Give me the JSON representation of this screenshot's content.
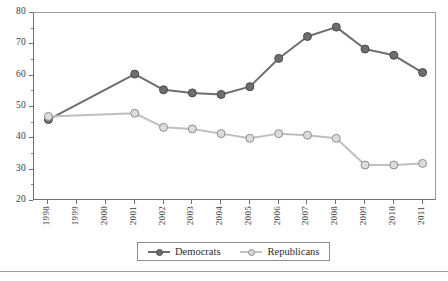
{
  "chart_data": {
    "type": "line",
    "title": "",
    "xlabel": "",
    "ylabel": "",
    "x": [
      1998,
      1999,
      2000,
      2001,
      2002,
      2003,
      2004,
      2005,
      2006,
      2007,
      2008,
      2009,
      2010,
      2011
    ],
    "categories": [
      "1998",
      "1999",
      "2000",
      "2001",
      "2002",
      "2003",
      "2004",
      "2005",
      "2006",
      "2007",
      "2008",
      "2009",
      "2010",
      "2011"
    ],
    "ylim": [
      20,
      80
    ],
    "yticks": [
      20,
      30,
      40,
      50,
      60,
      70,
      80
    ],
    "ytick_labels": [
      "20",
      "30",
      "40",
      "50",
      "60",
      "70",
      "80"
    ],
    "yminor_step": 5,
    "grid": false,
    "legend_position": "bottom-center",
    "series": [
      {
        "name": "Democrats",
        "color": "#6e6e6e",
        "marker": "circle-filled",
        "values": [
          46,
          null,
          null,
          60.5,
          55.5,
          54.5,
          54,
          56.5,
          65.5,
          72.5,
          75.5,
          68.5,
          66.5,
          61
        ],
        "markers_at": [
          1998,
          2001,
          2002,
          2003,
          2004,
          2005,
          2006,
          2007,
          2008,
          2009,
          2010,
          2011
        ]
      },
      {
        "name": "Republicans",
        "color": "#bfbfbf",
        "marker": "circle-open",
        "values": [
          47,
          null,
          null,
          48,
          43.5,
          43,
          41.5,
          40,
          41.5,
          41,
          40,
          31.5,
          31.5,
          32
        ],
        "markers_at": [
          1998,
          2001,
          2002,
          2003,
          2004,
          2005,
          2006,
          2007,
          2008,
          2009,
          2010,
          2011
        ]
      }
    ]
  },
  "legend": {
    "items": [
      {
        "label": "Democrats"
      },
      {
        "label": "Republicans"
      }
    ]
  },
  "colors": {
    "democrats": "#6e6e6e",
    "republicans": "#bfbfbf",
    "axis": "#6f6f6f",
    "text": "#2b2b2b"
  }
}
